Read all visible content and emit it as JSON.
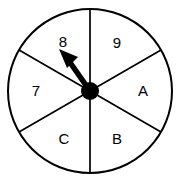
{
  "figure": {
    "type": "spinner-wheel",
    "background_color": "#ffffff",
    "line_color": "#000000",
    "sector_count": 6,
    "center": {
      "x": 90,
      "y": 91
    },
    "radius": 82,
    "hub_radius": 9
  },
  "sectors": [
    {
      "id": "sector-8",
      "label": "8",
      "label_x": 63,
      "label_y": 43,
      "start_deg": 120,
      "end_deg": 180
    },
    {
      "id": "sector-9",
      "label": "9",
      "label_x": 117,
      "label_y": 44,
      "start_deg": 60,
      "end_deg": 120
    },
    {
      "id": "sector-a",
      "label": "A",
      "label_x": 143,
      "label_y": 92,
      "start_deg": 0,
      "end_deg": 60
    },
    {
      "id": "sector-b",
      "label": "B",
      "label_x": 117,
      "label_y": 140,
      "start_deg": 300,
      "end_deg": 360
    },
    {
      "id": "sector-c",
      "label": "C",
      "label_x": 64,
      "label_y": 140,
      "start_deg": 240,
      "end_deg": 300
    },
    {
      "id": "sector-7",
      "label": "7",
      "label_x": 36,
      "label_y": 92,
      "start_deg": 180,
      "end_deg": 240
    }
  ],
  "pointer": {
    "name": "spinner-arrow",
    "points_to_label": "8",
    "angle_deg": 135,
    "tip": {
      "x": 60,
      "y": 50
    },
    "tail": {
      "x": 90,
      "y": 91
    },
    "color": "#000000"
  }
}
